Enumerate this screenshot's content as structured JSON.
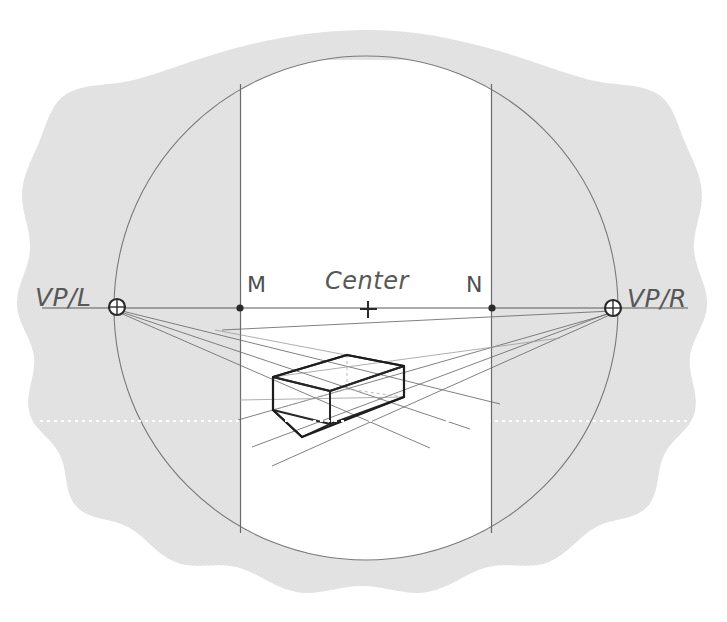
{
  "figure": {
    "type": "two-point-perspective-construction-diagram",
    "background_color": "#ffffff",
    "paper_color": "#e2e2e2",
    "line_color": "#555555",
    "heavy_line_color": "#2b2b2b",
    "labels": {
      "vp_left": "VP/L",
      "vp_right": "VP/R",
      "measure_left": "M",
      "measure_right": "N",
      "center": "Center"
    },
    "points": {
      "vp_left": {
        "x": 117,
        "y": 307,
        "marker": "circle-cross"
      },
      "vp_right": {
        "x": 613,
        "y": 308,
        "marker": "circle-cross"
      },
      "m": {
        "x": 240,
        "y": 308,
        "marker": "dot"
      },
      "n": {
        "x": 492,
        "y": 308,
        "marker": "dot"
      },
      "center": {
        "x": 368,
        "y": 309,
        "marker": "plus"
      }
    },
    "circle": {
      "cx": 366,
      "cy": 308,
      "r": 253,
      "stroke": "#6e6e6e"
    },
    "picture_plane_rect": {
      "x1": 240,
      "x2": 492,
      "y1": 85,
      "y2": 533
    },
    "horizon_line": {
      "y": 308,
      "x1": 40,
      "x2": 690
    },
    "dotted_guide": {
      "y": 421,
      "color": "#ffffff"
    },
    "box": {
      "name": "perspective-box",
      "top_front_left": {
        "x": 273,
        "y": 377
      },
      "top_apex": {
        "x": 404,
        "y": 366
      },
      "top_far": {
        "x": 347,
        "y": 355
      },
      "top_right": {
        "x": 404,
        "y": 366
      },
      "bottom_front": {
        "x": 302,
        "y": 437
      },
      "bottom_left": {
        "x": 273,
        "y": 410
      },
      "bottom_right": {
        "x": 404,
        "y": 397
      }
    }
  }
}
